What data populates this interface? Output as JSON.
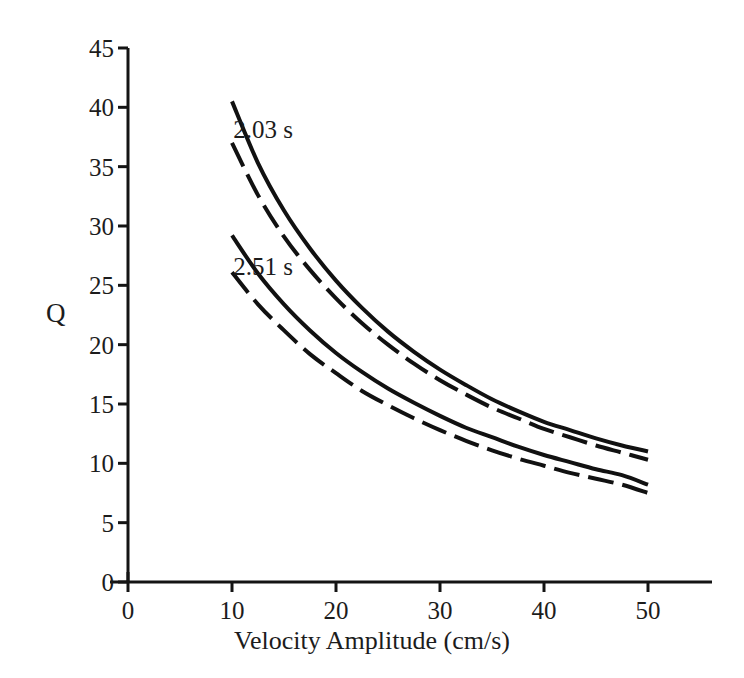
{
  "chart_data": {
    "type": "line",
    "title": "",
    "xlabel": "Velocity Amplitude (cm/s)",
    "ylabel": "Q",
    "xlim": [
      0,
      54
    ],
    "ylim": [
      0,
      45
    ],
    "xticks": [
      0,
      10,
      20,
      30,
      40,
      50
    ],
    "xtick_labels": [
      "0",
      "10",
      "20",
      "30",
      "40",
      "50"
    ],
    "yticks": [
      0,
      5,
      10,
      15,
      20,
      25,
      30,
      35,
      40,
      45
    ],
    "ytick_labels": [
      "0",
      "5",
      "10",
      "15",
      "20",
      "25",
      "30",
      "35",
      "40",
      "45"
    ],
    "grid": false,
    "legend": "none",
    "annotations": [
      {
        "text": "2.03 s",
        "x": 13.0,
        "y": 38.2
      },
      {
        "text": "2.51 s",
        "x": 13.0,
        "y": 26.6
      }
    ],
    "series": [
      {
        "name": "2.03 s solid",
        "style": "solid",
        "color": "#111111",
        "x": [
          10.0,
          12.5,
          15.0,
          17.5,
          20.0,
          22.5,
          25.0,
          27.5,
          30.0,
          32.5,
          35.0,
          37.5,
          40.0,
          42.5,
          45.0,
          47.5,
          50.0
        ],
        "y": [
          40.5,
          35.3,
          31.3,
          28.1,
          25.4,
          23.1,
          21.1,
          19.4,
          17.9,
          16.6,
          15.4,
          14.4,
          13.5,
          12.8,
          12.1,
          11.5,
          11.0
        ]
      },
      {
        "name": "2.03 s dashed",
        "style": "dashed",
        "color": "#111111",
        "x": [
          10.0,
          12.5,
          15.0,
          17.5,
          20.0,
          22.5,
          25.0,
          27.5,
          30.0,
          32.5,
          35.0,
          37.5,
          40.0,
          42.5,
          45.0,
          47.5,
          50.0
        ],
        "y": [
          37.0,
          32.6,
          29.1,
          26.3,
          23.9,
          21.8,
          20.0,
          18.4,
          17.0,
          15.8,
          14.7,
          13.8,
          12.9,
          12.2,
          11.5,
          10.9,
          10.3
        ]
      },
      {
        "name": "2.51 s solid",
        "style": "solid",
        "color": "#111111",
        "x": [
          10.0,
          12.5,
          15.0,
          17.5,
          20.0,
          22.5,
          25.0,
          27.5,
          30.0,
          32.5,
          35.0,
          37.5,
          40.0,
          42.5,
          45.0,
          47.5,
          50.0
        ],
        "y": [
          29.2,
          26.0,
          23.4,
          21.2,
          19.3,
          17.7,
          16.3,
          15.1,
          14.0,
          13.0,
          12.2,
          11.4,
          10.7,
          10.1,
          9.5,
          9.0,
          8.2
        ]
      },
      {
        "name": "2.51 s dashed",
        "style": "dashed",
        "color": "#111111",
        "x": [
          10.0,
          12.5,
          15.0,
          17.5,
          20.0,
          22.5,
          25.0,
          27.5,
          30.0,
          32.5,
          35.0,
          37.5,
          40.0,
          42.5,
          45.0,
          47.5,
          50.0
        ],
        "y": [
          26.1,
          23.4,
          21.2,
          19.2,
          17.6,
          16.1,
          14.9,
          13.8,
          12.8,
          11.9,
          11.1,
          10.4,
          9.8,
          9.2,
          8.7,
          8.2,
          7.5
        ]
      }
    ]
  }
}
